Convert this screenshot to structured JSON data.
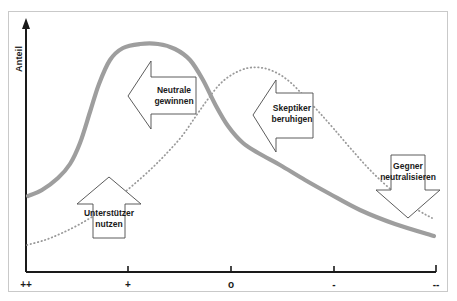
{
  "chart_data": {
    "type": "line",
    "title": "",
    "subtitle": "",
    "xlabel": "",
    "ylabel": "Anteil",
    "grid": false,
    "legend_position": "none",
    "x_tick_labels": [
      "++",
      "+",
      "o",
      "-",
      "--"
    ],
    "x_tick_positions_px": [
      26,
      128,
      231,
      334,
      436
    ],
    "xlim_labels": [
      "++",
      "--"
    ],
    "ylim": [
      0,
      1
    ],
    "series": [
      {
        "name": "solid-gray-curve",
        "style": "solid",
        "color": "#9e9e9e",
        "width_px": 4.2,
        "description": "S-curve rising from low-left, plateau peak near '+' to left of 'o', then falling steadily toward '--'",
        "points": [
          [
            28,
            196
          ],
          [
            42,
            190
          ],
          [
            58,
            178
          ],
          [
            70,
            164
          ],
          [
            80,
            143
          ],
          [
            90,
            112
          ],
          [
            99,
            84
          ],
          [
            110,
            60
          ],
          [
            123,
            48
          ],
          [
            140,
            44
          ],
          [
            158,
            44
          ],
          [
            175,
            49
          ],
          [
            190,
            60
          ],
          [
            203,
            80
          ],
          [
            215,
            104
          ],
          [
            228,
            126
          ],
          [
            243,
            143
          ],
          [
            260,
            154
          ],
          [
            280,
            165
          ],
          [
            305,
            180
          ],
          [
            330,
            194
          ],
          [
            360,
            210
          ],
          [
            395,
            224
          ],
          [
            434,
            236
          ]
        ]
      },
      {
        "name": "dotted-gray-curve",
        "style": "dotted",
        "color": "#9a9a9a",
        "width_px": 1.8,
        "description": "Inverted-U dotted curve rising from bottom-left, peaking right of 'o', then falling to lower right",
        "points": [
          [
            27,
            245
          ],
          [
            45,
            240
          ],
          [
            62,
            233
          ],
          [
            80,
            224
          ],
          [
            98,
            213
          ],
          [
            115,
            200
          ],
          [
            132,
            186
          ],
          [
            150,
            170
          ],
          [
            166,
            154
          ],
          [
            182,
            136
          ],
          [
            196,
            116
          ],
          [
            208,
            99
          ],
          [
            220,
            84
          ],
          [
            233,
            74
          ],
          [
            248,
            68
          ],
          [
            263,
            68
          ],
          [
            277,
            73
          ],
          [
            290,
            82
          ],
          [
            303,
            95
          ],
          [
            318,
            111
          ],
          [
            334,
            129
          ],
          [
            352,
            150
          ],
          [
            372,
            172
          ],
          [
            395,
            193
          ],
          [
            418,
            210
          ],
          [
            432,
            218
          ]
        ]
      }
    ],
    "annotations": [
      {
        "id": "unterstuetzer",
        "label_lines": [
          "Unterstützer",
          "nutzen"
        ],
        "shape": "arrow-up",
        "points_to": "solid-curve-low-left-segment",
        "box_px": {
          "x": 78,
          "y": 203,
          "w": 62,
          "h": 35
        },
        "apex_px": {
          "x": 109,
          "y": 177
        }
      },
      {
        "id": "neutrale",
        "label_lines": [
          "Neutrale",
          "gewinnen"
        ],
        "shape": "arrow-left",
        "points_to": "solid-curve-plateau",
        "box_px": {
          "x": 150,
          "y": 61,
          "w": 46,
          "h": 67
        },
        "tip_px": {
          "x": 128,
          "y": 96
        }
      },
      {
        "id": "skeptiker",
        "label_lines": [
          "Skeptiker",
          "beruhigen"
        ],
        "shape": "arrow-left",
        "points_to": "solid-curve-descent",
        "box_px": {
          "x": 275,
          "y": 80,
          "w": 38,
          "h": 72
        },
        "tip_px": {
          "x": 253,
          "y": 115
        }
      },
      {
        "id": "gegner",
        "label_lines": [
          "Gegner",
          "neutralisieren"
        ],
        "shape": "arrow-down",
        "points_to": "solid-curve-tail",
        "box_px": {
          "x": 376,
          "y": 155,
          "w": 64,
          "h": 35
        },
        "tip_px": {
          "x": 408,
          "y": 218
        }
      }
    ]
  },
  "axes": {
    "y_axis_label": "Anteil",
    "x_ticks": [
      {
        "label": "++"
      },
      {
        "label": "+"
      },
      {
        "label": "o"
      },
      {
        "label": "-"
      },
      {
        "label": "--"
      }
    ]
  },
  "callouts": {
    "unterstuetzer": {
      "line1": "Unterstützer",
      "line2": "nutzen"
    },
    "neutrale": {
      "line1": "Neutrale",
      "line2": "gewinnen"
    },
    "skeptiker": {
      "line1": "Skeptiker",
      "line2": "beruhigen"
    },
    "gegner": {
      "line1": "Gegner",
      "line2": "neutralisieren"
    }
  },
  "colors": {
    "solid_curve": "#9e9e9e",
    "dotted_curve": "#9a9a9a",
    "axis": "#1a1a1a",
    "frame_border": "#c9c9c9",
    "callout_stroke": "#4a4a4a",
    "background": "#ffffff"
  }
}
